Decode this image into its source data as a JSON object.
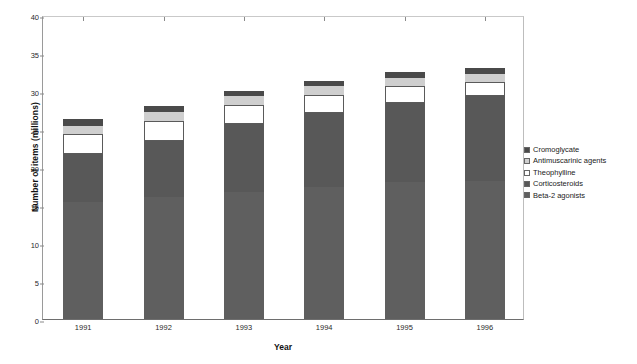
{
  "chart_data": {
    "type": "bar",
    "stacked": true,
    "title": "",
    "xlabel": "Year",
    "ylabel": "Number of items (millions)",
    "categories": [
      "1991",
      "1992",
      "1993",
      "1994",
      "1995",
      "1996"
    ],
    "ylim": [
      0,
      40
    ],
    "yticks": [
      0,
      5,
      10,
      15,
      20,
      25,
      30,
      35,
      40
    ],
    "grid": false,
    "legend_position": "right",
    "series": [
      {
        "name": "Beta-2 agonists",
        "color": "#5f5f5f",
        "values": [
          15.4,
          16.0,
          16.7,
          17.4,
          18.0,
          18.1
        ]
      },
      {
        "name": "Corticosteroids",
        "color": "#585858",
        "values": [
          6.3,
          7.4,
          8.9,
          9.7,
          10.4,
          11.2
        ]
      },
      {
        "name": "Theophylline",
        "color": "#ffffff",
        "values": [
          2.6,
          2.7,
          2.6,
          2.4,
          2.2,
          1.9
        ]
      },
      {
        "name": "Antimuscarinic agents",
        "color": "#cfcfcf",
        "values": [
          1.1,
          1.1,
          1.1,
          1.1,
          1.1,
          1.1
        ]
      },
      {
        "name": "Cromoglycate",
        "color": "#4a4a4a",
        "values": [
          0.9,
          0.8,
          0.7,
          0.7,
          0.8,
          0.7
        ]
      }
    ],
    "totals": [
      26.3,
      28.0,
      30.0,
      31.3,
      32.5,
      33.0
    ],
    "legend_entries": [
      {
        "label": "Cromoglycate",
        "color": "#4a4a4a"
      },
      {
        "label": "Antimuscarinic agents",
        "color": "#cfcfcf"
      },
      {
        "label": "Theophylline",
        "color": "#ffffff"
      },
      {
        "label": "Corticosteroids",
        "color": "#585858"
      },
      {
        "label": "Beta-2 agonists",
        "color": "#5f5f5f"
      }
    ]
  }
}
